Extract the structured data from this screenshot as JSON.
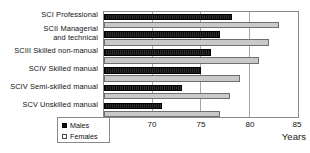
{
  "chart_data": {
    "type": "bar",
    "orientation": "horizontal",
    "title": "",
    "xlabel": "Years",
    "ylabel": "",
    "xlim": [
      65,
      85
    ],
    "xticks": [
      65,
      70,
      75,
      80,
      85
    ],
    "grid": true,
    "legend_position": "bottom-left",
    "categories": [
      "SCI Professional",
      "SCII Managerial and technical",
      "SCIII Skilled non-manual",
      "SCIV Skilled manual",
      "SCIV Semi-skilled manual",
      "SCV Unskilled manual"
    ],
    "category_lines": [
      [
        "SCI Professional"
      ],
      [
        "SCII Managerial",
        "and technical"
      ],
      [
        "SCIII Skilled non-manual"
      ],
      [
        "SCIV Skilled manual"
      ],
      [
        "SCIV Semi-skilled manual"
      ],
      [
        "SCV Unskilled manual"
      ]
    ],
    "series": [
      {
        "name": "Males",
        "color": "#0d0d0d",
        "values": [
          78.2,
          77.0,
          76.0,
          75.0,
          73.0,
          71.0
        ]
      },
      {
        "name": "Females",
        "color": "#c9c9c9",
        "values": [
          83.0,
          82.0,
          81.0,
          79.0,
          78.0,
          77.0
        ]
      }
    ]
  },
  "legend": {
    "items": [
      {
        "label": "Males"
      },
      {
        "label": "Females"
      }
    ]
  }
}
